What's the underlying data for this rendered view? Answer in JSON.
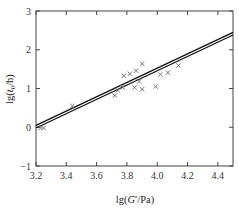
{
  "chart_data": {
    "type": "scatter",
    "title": "",
    "xlabel": "lg(G'/Pa)",
    "ylabel": "lg(t0/h)",
    "xlim": [
      3.2,
      4.5
    ],
    "ylim": [
      -1,
      3
    ],
    "xticks": [
      3.2,
      3.4,
      3.6,
      3.8,
      4.0,
      4.2,
      4.4
    ],
    "xtick_labels": [
      "3.2",
      "3.4",
      "3.6",
      "3.8",
      "4.0",
      "4.2",
      "4.4"
    ],
    "yticks": [
      -1,
      0,
      1,
      2,
      3
    ],
    "ytick_labels": [
      "−1",
      "0",
      "1",
      "2",
      "3"
    ],
    "grid": false,
    "legend": null,
    "series": [
      {
        "name": "measured",
        "marker": "x",
        "points": [
          [
            3.23,
            -0.02
          ],
          [
            3.25,
            -0.02
          ],
          [
            3.44,
            0.55
          ],
          [
            3.72,
            0.82
          ],
          [
            3.74,
            0.95
          ],
          [
            3.77,
            1.03
          ],
          [
            3.78,
            1.33
          ],
          [
            3.82,
            1.38
          ],
          [
            3.86,
            1.46
          ],
          [
            3.9,
            1.64
          ],
          [
            3.85,
            1.03
          ],
          [
            3.88,
            1.18
          ],
          [
            3.9,
            0.98
          ],
          [
            3.99,
            1.05
          ],
          [
            4.02,
            1.36
          ],
          [
            4.07,
            1.41
          ],
          [
            4.14,
            1.59
          ]
        ]
      },
      {
        "name": "fit-upper",
        "type": "line",
        "points": [
          [
            3.2,
            0.05
          ],
          [
            4.5,
            2.45
          ]
        ]
      },
      {
        "name": "fit-lower",
        "type": "line",
        "points": [
          [
            3.2,
            -0.02
          ],
          [
            4.5,
            2.38
          ]
        ]
      }
    ]
  },
  "axes": {
    "xlabel_prefix": "lg(",
    "xlabel_var": "G",
    "xlabel_prime": "′",
    "xlabel_suffix": "/Pa)",
    "ylabel_prefix": "lg(",
    "ylabel_var": "t",
    "ylabel_sub": "0",
    "ylabel_suffix": "/h)"
  }
}
